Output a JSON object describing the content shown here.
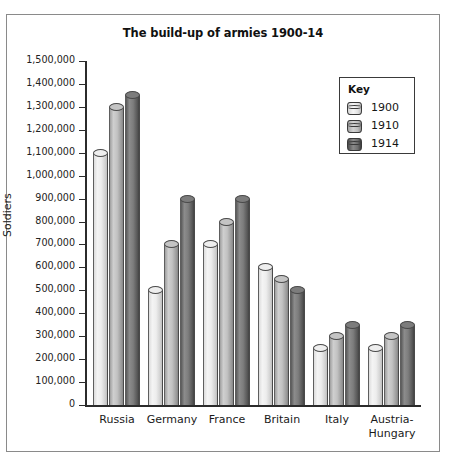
{
  "chart_data": {
    "type": "bar",
    "title": "The build-up of armies 1900-14",
    "xlabel": "",
    "ylabel": "Soldiers",
    "categories": [
      "Russia",
      "Germany",
      "France",
      "Britain",
      "Italy",
      "Austria-\nHungary"
    ],
    "series": [
      {
        "name": "1900",
        "values": [
          1100000,
          500000,
          700000,
          600000,
          250000,
          250000
        ],
        "color": "#ededed"
      },
      {
        "name": "1910",
        "values": [
          1300000,
          700000,
          800000,
          550000,
          300000,
          300000
        ],
        "color": "#c2c2c2"
      },
      {
        "name": "1914",
        "values": [
          1350000,
          900000,
          900000,
          500000,
          350000,
          350000
        ],
        "color": "#7d7d7d"
      }
    ],
    "ylim": [
      0,
      1500000
    ],
    "ytick_values": [
      0,
      100000,
      200000,
      300000,
      400000,
      500000,
      600000,
      700000,
      800000,
      900000,
      1000000,
      1100000,
      1200000,
      1300000,
      1400000,
      1500000
    ],
    "ytick_labels": [
      "0",
      "100,000",
      "200,000",
      "300,000",
      "400,000",
      "500,000",
      "600,000",
      "700,000",
      "800,000",
      "900,000",
      "1,000,000",
      "1,100,000",
      "1,200,000",
      "1,300,000",
      "1,400,000",
      "1,500,000"
    ],
    "grid": false,
    "legend": {
      "title": "Key",
      "position": "top-right",
      "entries": [
        "1900",
        "1910",
        "1914"
      ]
    },
    "bar_style": "cylinder-3d"
  }
}
